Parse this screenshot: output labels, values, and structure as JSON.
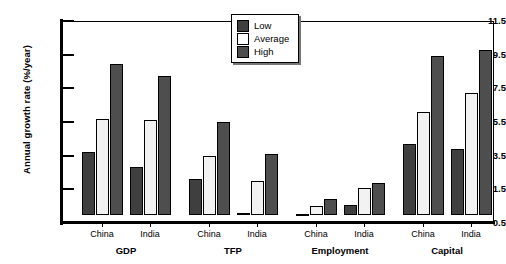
{
  "chart_data": {
    "type": "bar",
    "title": "",
    "xlabel": "",
    "ylabel": "Annual growth rate (%/year)",
    "ylim": [
      -0.5,
      11.5
    ],
    "yticks": [
      "11.5",
      "9.5",
      "7.5",
      "5.5",
      "3.5",
      "1.5",
      "-0.5"
    ],
    "grid": false,
    "legend_position": "top-center-right",
    "groups": [
      "GDP",
      "TFP",
      "Employment",
      "Capital"
    ],
    "categories": [
      "GDP China",
      "GDP India",
      "TFP China",
      "TFP India",
      "Employment China",
      "Employment India",
      "Capital China",
      "Capital India"
    ],
    "series": [
      {
        "name": "Low",
        "color": "#3f3f3f",
        "values": [
          3.7,
          2.8,
          2.1,
          0.0,
          -0.1,
          0.6,
          4.2,
          3.9
        ]
      },
      {
        "name": "Average",
        "color": "#f2f2f2",
        "values": [
          5.7,
          5.6,
          3.5,
          2.0,
          0.5,
          1.6,
          6.1,
          7.2
        ]
      },
      {
        "name": "High",
        "color": "#4e4e4e",
        "values": [
          8.95,
          8.25,
          5.5,
          3.6,
          0.9,
          1.9,
          9.45,
          9.8
        ]
      }
    ]
  },
  "axis": {
    "y_title": "Annual growth rate (%/year)",
    "y_ticks": [
      "11.5",
      "9.5",
      "7.5",
      "5.5",
      "3.5",
      "1.5",
      "-0.5"
    ]
  },
  "legend": {
    "items": [
      {
        "label": "Low"
      },
      {
        "label": "Average"
      },
      {
        "label": "High"
      }
    ]
  },
  "x_axis": {
    "groups": [
      {
        "label": "GDP",
        "countries": [
          "China",
          "India"
        ]
      },
      {
        "label": "TFP",
        "countries": [
          "China",
          "India"
        ]
      },
      {
        "label": "Employment",
        "countries": [
          "China",
          "India"
        ]
      },
      {
        "label": "Capital",
        "countries": [
          "China",
          "India"
        ]
      }
    ]
  }
}
